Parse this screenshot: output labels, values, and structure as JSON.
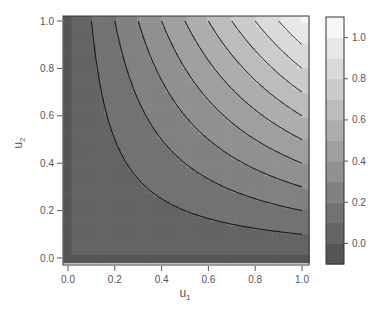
{
  "chart_data": {
    "type": "heatmap",
    "subtype": "filled-contour",
    "title": "",
    "function_depicted": "z = u1 * u2",
    "xlabel": "u1",
    "ylabel": "u2",
    "xlim": [
      -0.02,
      1.03
    ],
    "ylim": [
      -0.02,
      1.03
    ],
    "x_ticks": [
      "0.0",
      "0.2",
      "0.4",
      "0.6",
      "0.8",
      "1.0"
    ],
    "y_ticks": [
      "0.0",
      "0.2",
      "0.4",
      "0.6",
      "0.8",
      "1.0"
    ],
    "contour_levels": [
      0.1,
      0.2,
      0.3,
      0.4,
      0.5,
      0.6,
      0.7,
      0.8,
      0.9
    ],
    "colorbar": {
      "range": [
        -0.1,
        1.1
      ],
      "band_width": 0.1,
      "ticks": [
        "0.0",
        "0.2",
        "0.4",
        "0.6",
        "0.8",
        "1.0"
      ],
      "tick_values": [
        0.0,
        0.2,
        0.4,
        0.6,
        0.8,
        1.0
      ],
      "color_low": "#555555",
      "color_high": "#f7f7f7"
    },
    "grid": false,
    "legend_position": "right"
  }
}
